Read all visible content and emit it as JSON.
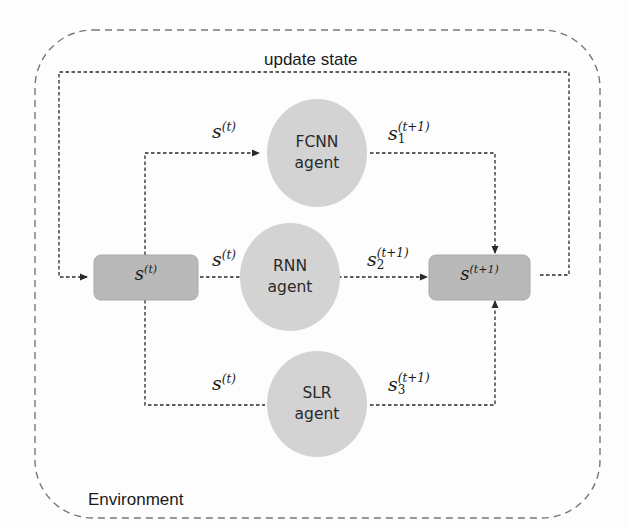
{
  "diagram": {
    "environment_label": "Environment",
    "update_label": "update state",
    "state_box": {
      "base": "s",
      "sup": "(t)"
    },
    "next_state_box": {
      "base": "s",
      "sup": "(t+1)"
    },
    "agents": [
      {
        "name": "FCNN",
        "suffix": "agent",
        "input": {
          "base": "s",
          "sup": "(t)"
        },
        "output": {
          "base": "s",
          "sub": "1",
          "sup": "(t+1)"
        }
      },
      {
        "name": "RNN",
        "suffix": "agent",
        "input": {
          "base": "s",
          "sup": "(t)"
        },
        "output": {
          "base": "s",
          "sub": "2",
          "sup": "(t+1)"
        }
      },
      {
        "name": "SLR",
        "suffix": "agent",
        "input": {
          "base": "s",
          "sup": "(t)"
        },
        "output": {
          "base": "s",
          "sub": "3",
          "sup": "(t+1)"
        }
      }
    ],
    "colors": {
      "box_fill": "#b9b9b9",
      "circle_fill": "#d3d3d3",
      "line": "#2a2a2a",
      "env_border": "#777777"
    }
  }
}
